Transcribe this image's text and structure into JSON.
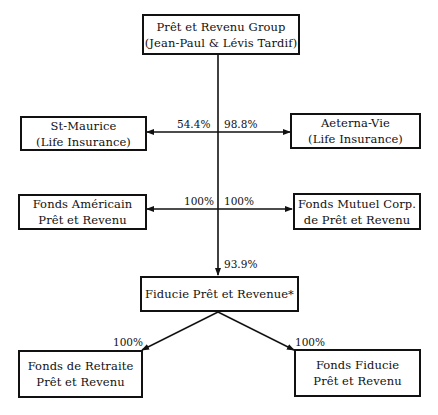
{
  "diagram": {
    "type": "ownership-structure",
    "nodes": {
      "parent": {
        "line1": "Prêt et Revenu Group",
        "line2": "(Jean-Paul & Lévis Tardif)"
      },
      "st_maurice": {
        "line1": "St-Maurice",
        "line2": "(Life Insurance)"
      },
      "aeterna_vie": {
        "line1": "Aeterna-Vie",
        "line2": "(Life Insurance)"
      },
      "fonds_americain": {
        "line1": "Fonds Américain",
        "line2": "Prêt et Revenu"
      },
      "fonds_mutuel": {
        "line1": "Fonds Mutuel Corp.",
        "line2": "de Prêt et Revenu"
      },
      "fiducie": {
        "line1": "Fiducie Prêt et Revenue*"
      },
      "fonds_retraite": {
        "line1": "Fonds de Retraite",
        "line2": "Prêt et Revenu"
      },
      "fonds_fiducie": {
        "line1": "Fonds Fiducie",
        "line2": "Prêt et Revenu"
      }
    },
    "edges": [
      {
        "from": "parent",
        "to": "st_maurice",
        "label": "54.4%"
      },
      {
        "from": "parent",
        "to": "aeterna_vie",
        "label": "98.8%"
      },
      {
        "from": "parent",
        "to": "fonds_americain",
        "label": "100%"
      },
      {
        "from": "parent",
        "to": "fonds_mutuel",
        "label": "100%"
      },
      {
        "from": "parent",
        "to": "fiducie",
        "label": "93.9%"
      },
      {
        "from": "fiducie",
        "to": "fonds_retraite",
        "label": "100%"
      },
      {
        "from": "fiducie",
        "to": "fonds_fiducie",
        "label": "100%"
      }
    ]
  },
  "colors": {
    "line": "#111111",
    "background": "#ffffff"
  }
}
